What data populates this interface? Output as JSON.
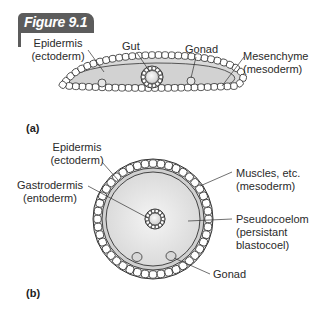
{
  "figure": {
    "label": "Figure 9.1",
    "tab_color": "#5c5c5c"
  },
  "panel_a": {
    "letter": "(a)",
    "labels": {
      "epidermis": "Epidermis",
      "epidermis_sub": "(ectoderm)",
      "gut": "Gut",
      "gonad": "Gonad",
      "mesenchyme": "Mesenchyme",
      "mesenchyme_sub": "(mesoderm)"
    }
  },
  "panel_b": {
    "letter": "(b)",
    "labels": {
      "epidermis": "Epidermis",
      "epidermis_sub": "(ectoderm)",
      "gastrodermis": "Gastrodermis",
      "gastrodermis_sub": "(entoderm)",
      "muscles": "Muscles, etc.",
      "muscles_sub": "(mesoderm)",
      "pseudocoelom": "Pseudocoelom",
      "pseudocoelom_sub1": "(persistant",
      "pseudocoelom_sub2": "blastocoel)",
      "gonad": "Gonad"
    }
  }
}
